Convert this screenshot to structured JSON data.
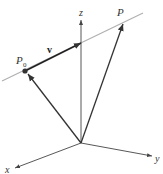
{
  "diagram": {
    "axes": {
      "x_label": "x",
      "y_label": "y",
      "z_label": "z"
    },
    "points": {
      "p0_label": "P",
      "p0_subscript": "0",
      "p_label": "P"
    },
    "vectors": {
      "direction_label": "v"
    },
    "colors": {
      "line": "#b0b0b0",
      "arrows": "#333333",
      "axes": "#444444",
      "point": "#333333"
    }
  }
}
